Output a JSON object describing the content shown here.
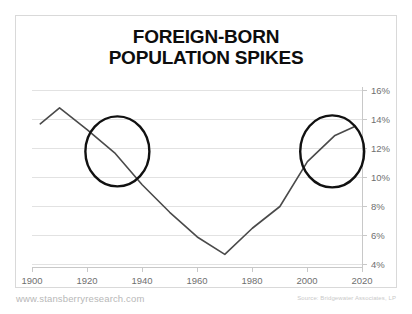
{
  "title": "FOREIGN-BORN\nPOPULATION SPIKES",
  "footer": {
    "website": "www.stansberryresearch.com",
    "source": "Source: Bridgewater Associates, LP"
  },
  "colors": {
    "line": "#4a4a4a",
    "annotation_circle": "#111111",
    "gridline": "#e2e2e2",
    "axis": "#c0c0c0",
    "title_text": "#0d0d0d",
    "tick_text": "#6f6f6f",
    "frame": "#d9d9d9",
    "footer_left_text": "#b8b8b8",
    "footer_right_text": "#c9c9c9"
  },
  "chart_data": {
    "type": "line",
    "title": "FOREIGN-BORN POPULATION SPIKES",
    "xlabel": "",
    "ylabel": "",
    "xlim": [
      1900,
      2020
    ],
    "ylim": [
      4,
      16
    ],
    "grid": true,
    "legend": false,
    "y_tick_labels": [
      "16%",
      "14%",
      "12%",
      "10%",
      "8%",
      "6%",
      "4%"
    ],
    "y_ticks": [
      16,
      14,
      12,
      10,
      8,
      6,
      4
    ],
    "y_axis_position": "right",
    "x_tick_labels": [
      "1900",
      "1920",
      "1940",
      "1960",
      "1980",
      "2000",
      "2020"
    ],
    "x_ticks": [
      1900,
      1920,
      1940,
      1960,
      1980,
      2000,
      2020
    ],
    "series": [
      {
        "name": "Foreign-born share of U.S. population",
        "x": [
          1903,
          1910,
          1920,
          1930,
          1940,
          1950,
          1960,
          1970,
          1980,
          1990,
          2000,
          2010,
          2017
        ],
        "values": [
          13.7,
          14.8,
          13.3,
          11.7,
          9.5,
          7.6,
          5.9,
          4.7,
          6.5,
          8.0,
          11.1,
          12.9,
          13.5
        ]
      }
    ],
    "annotations": [
      {
        "type": "circle",
        "name": "left-spike-circle",
        "center_x": 1931,
        "center_y": 11.8,
        "label": ""
      },
      {
        "type": "circle",
        "name": "right-spike-circle",
        "center_x": 2009,
        "center_y": 11.8,
        "label": ""
      }
    ]
  }
}
